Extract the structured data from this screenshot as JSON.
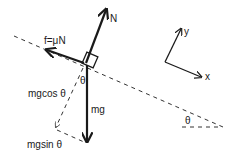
{
  "diagram": {
    "type": "free-body diagram, block on inclined plane",
    "labels": {
      "normal": "N",
      "friction": "f=μN",
      "weight": "mg",
      "perpendicular_component": "mgcos θ",
      "parallel_component": "mgsin θ",
      "angle_at_block": "θ",
      "angle_at_incline": "θ",
      "axis_x": "x",
      "axis_y": "y"
    },
    "colors": {
      "ink": "#1a1a1a",
      "background": "#ffffff"
    }
  }
}
